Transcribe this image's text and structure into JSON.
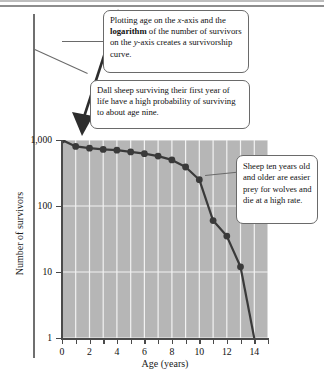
{
  "figure": {
    "callouts": [
      {
        "id": "axes-explanation",
        "text_before": "Plotting age on the ",
        "italic1": "x",
        "text_mid1": "-axis and the ",
        "bold1": "logarithm",
        "text_mid2": " of the number of survivors on the ",
        "italic2": "y",
        "text_after": "-axis creates a survivorship curve."
      },
      {
        "id": "first-year-survival",
        "text": "Dall sheep surviving their first year of life have a high probability of surviving to about age nine."
      },
      {
        "id": "ten-years-mortality",
        "text": "Sheep ten years old and older are easier prey for wolves and die at a high rate."
      }
    ]
  },
  "chart_data": {
    "type": "line",
    "title": "",
    "xlabel": "Age (years)",
    "ylabel": "Number of survivors",
    "yscale": "log",
    "xlim": [
      0,
      15
    ],
    "ylim": [
      1,
      1000
    ],
    "grid": true,
    "legend": "none",
    "xticks": [
      0,
      1,
      2,
      3,
      4,
      5,
      6,
      7,
      8,
      9,
      10,
      11,
      12,
      13,
      14,
      15
    ],
    "xticklabels": [
      "0",
      "",
      "2",
      "",
      "4",
      "",
      "6",
      "",
      "8",
      "",
      "10",
      "",
      "12",
      "",
      "14",
      ""
    ],
    "xticklabels_shown": [
      "0",
      "2",
      "4",
      "6",
      "8",
      "10",
      "12",
      "14"
    ],
    "yticks": [
      1,
      10,
      100,
      1000
    ],
    "yticklabels": [
      "1",
      "10",
      "100",
      "1,000"
    ],
    "series": [
      {
        "name": "Dall sheep survivors",
        "marker": "circle",
        "color": "#3a3a3a",
        "x": [
          0,
          1,
          2,
          3,
          4,
          5,
          6,
          7,
          8,
          9,
          10,
          11,
          12,
          13
        ],
        "y": [
          1000,
          800,
          750,
          720,
          700,
          660,
          620,
          570,
          500,
          390,
          250,
          60,
          35,
          12
        ]
      }
    ]
  }
}
